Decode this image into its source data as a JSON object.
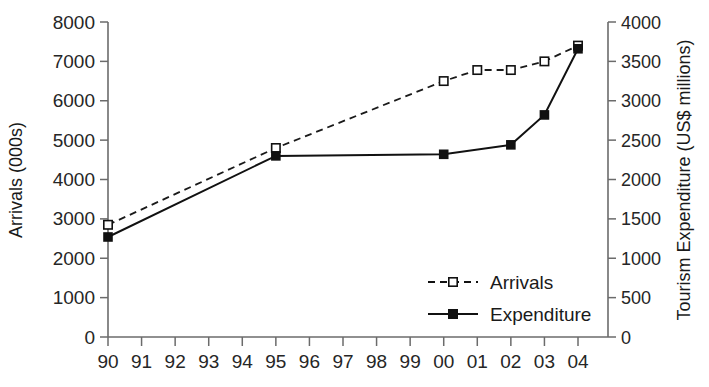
{
  "chart_data": {
    "type": "line",
    "title": "",
    "subtitle": "",
    "xlabel": "",
    "categories": [
      "90",
      "91",
      "92",
      "93",
      "94",
      "95",
      "96",
      "97",
      "98",
      "99",
      "00",
      "01",
      "02",
      "03",
      "04"
    ],
    "grid": false,
    "legend_position": "inside-bottom-right",
    "axes": {
      "left": {
        "label": "Arrivals (000s)",
        "ylim": [
          0,
          8000
        ],
        "ticks": [
          0,
          1000,
          2000,
          3000,
          4000,
          5000,
          6000,
          7000,
          8000
        ],
        "tick_labels": [
          "0",
          "1000",
          "2000",
          "3000",
          "4000",
          "5000",
          "6000",
          "7000",
          "8000"
        ]
      },
      "right": {
        "label": "Tourism Expenditure (US$ millions)",
        "ylim": [
          0,
          4000
        ],
        "ticks": [
          0,
          500,
          1000,
          1500,
          2000,
          2500,
          3000,
          3500,
          4000
        ],
        "tick_labels": [
          "0",
          "500",
          "1000",
          "1500",
          "2000",
          "2500",
          "3000",
          "3500",
          "4000"
        ]
      }
    },
    "series": [
      {
        "name": "Arrivals",
        "axis": "left",
        "units": "000s",
        "line_style": "dashed",
        "marker": "open-square",
        "color": "#111111",
        "x": [
          "90",
          "91",
          "92",
          "93",
          "94",
          "95",
          "96",
          "97",
          "98",
          "99",
          "00",
          "01",
          "02",
          "03",
          "04"
        ],
        "values": [
          2850,
          null,
          null,
          null,
          null,
          4800,
          null,
          null,
          null,
          null,
          6500,
          6780,
          6780,
          7000,
          7400
        ],
        "marker_points": [
          {
            "x": "90",
            "y": 2850
          },
          {
            "x": "95",
            "y": 4800
          },
          {
            "x": "00",
            "y": 6500
          },
          {
            "x": "01",
            "y": 6780
          },
          {
            "x": "02",
            "y": 6780
          },
          {
            "x": "03",
            "y": 7000
          },
          {
            "x": "04",
            "y": 7400
          }
        ]
      },
      {
        "name": "Expenditure",
        "axis": "right",
        "units": "US$ millions",
        "line_style": "solid",
        "marker": "filled-square",
        "color": "#111111",
        "x": [
          "90",
          "91",
          "92",
          "93",
          "94",
          "95",
          "96",
          "97",
          "98",
          "99",
          "00",
          "01",
          "02",
          "03",
          "04"
        ],
        "values": [
          1270,
          null,
          null,
          null,
          null,
          2300,
          null,
          null,
          null,
          null,
          2320,
          null,
          2440,
          2820,
          3660
        ],
        "marker_points": [
          {
            "x": "90",
            "y": 1270
          },
          {
            "x": "95",
            "y": 2300
          },
          {
            "x": "00",
            "y": 2320
          },
          {
            "x": "02",
            "y": 2440
          },
          {
            "x": "03",
            "y": 2820
          },
          {
            "x": "04",
            "y": 3660
          }
        ]
      }
    ],
    "legend": [
      {
        "label": "Arrivals",
        "marker": "open-square",
        "line_style": "dashed"
      },
      {
        "label": "Expenditure",
        "marker": "filled-square",
        "line_style": "solid"
      }
    ]
  }
}
